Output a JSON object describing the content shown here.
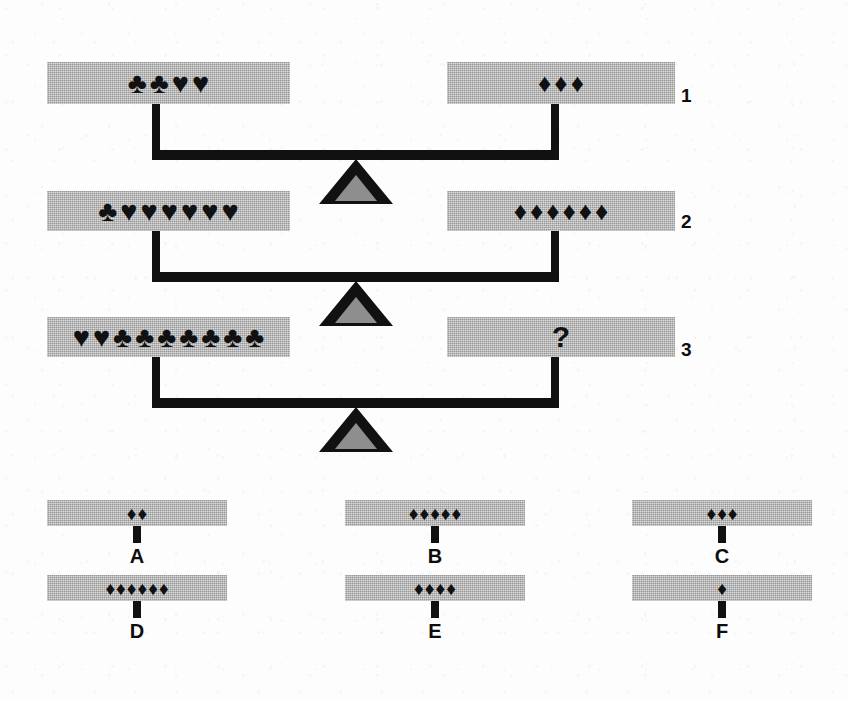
{
  "puzzle": {
    "kind": "balance-scale-equation",
    "question_mark": "?",
    "glyphs": {
      "club": "♣",
      "heart": "♥",
      "diamond": "♦"
    }
  },
  "scales": [
    {
      "label": "1",
      "left": {
        "items": [
          "club",
          "club",
          "heart",
          "heart"
        ],
        "counts": {
          "club": 2,
          "heart": 2,
          "diamond": 0
        }
      },
      "right": {
        "items": [
          "diamond",
          "diamond",
          "diamond"
        ],
        "counts": {
          "club": 0,
          "heart": 0,
          "diamond": 3
        }
      }
    },
    {
      "label": "2",
      "left": {
        "items": [
          "club",
          "heart",
          "heart",
          "heart",
          "heart",
          "heart",
          "heart"
        ],
        "counts": {
          "club": 1,
          "heart": 6,
          "diamond": 0
        }
      },
      "right": {
        "items": [
          "diamond",
          "diamond",
          "diamond",
          "diamond",
          "diamond",
          "diamond"
        ],
        "counts": {
          "club": 0,
          "heart": 0,
          "diamond": 6
        }
      }
    },
    {
      "label": "3",
      "left": {
        "items": [
          "heart",
          "heart",
          "club",
          "club",
          "club",
          "club",
          "club",
          "club",
          "club"
        ],
        "counts": {
          "club": 7,
          "heart": 2,
          "diamond": 0
        }
      },
      "right": {
        "items": [],
        "unknown": "?",
        "counts": {
          "club": 0,
          "heart": 0,
          "diamond": 0
        }
      }
    }
  ],
  "options": [
    {
      "letter": "A",
      "items": [
        "diamond",
        "diamond"
      ],
      "count": 2
    },
    {
      "letter": "B",
      "items": [
        "diamond",
        "diamond",
        "diamond",
        "diamond",
        "diamond"
      ],
      "count": 5
    },
    {
      "letter": "C",
      "items": [
        "diamond",
        "diamond",
        "diamond"
      ],
      "count": 3
    },
    {
      "letter": "D",
      "items": [
        "diamond",
        "diamond",
        "diamond",
        "diamond",
        "diamond",
        "diamond"
      ],
      "count": 6
    },
    {
      "letter": "E",
      "items": [
        "diamond",
        "diamond",
        "diamond",
        "diamond"
      ],
      "count": 4
    },
    {
      "letter": "F",
      "items": [
        "diamond"
      ],
      "count": 1
    }
  ],
  "colors": {
    "pan_gray": "#a8a8a8",
    "ink_black": "#111111",
    "fulcrum_fill": "#8e8e8e",
    "page": "#fdfdfd"
  }
}
